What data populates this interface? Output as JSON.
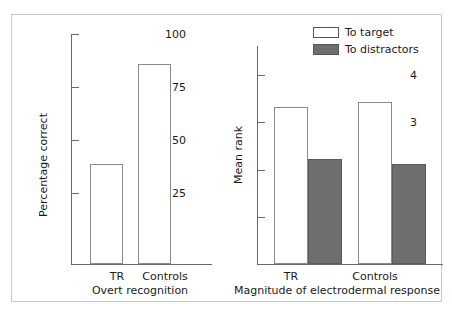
{
  "chart_data": [
    {
      "id": "overt-recognition",
      "type": "bar",
      "title": "",
      "xlabel": "Overt recognition",
      "ylabel": "Percentage correct",
      "categories": [
        "TR",
        "Controls"
      ],
      "values": [
        47,
        94
      ],
      "ylim": [
        0,
        100
      ],
      "yticks": [
        25,
        50,
        75,
        100
      ],
      "ytick_labels": [
        "25",
        "50",
        "75",
        "100"
      ],
      "grid": false,
      "legend": "none",
      "series": [
        {
          "name": "Percentage correct",
          "values": [
            47,
            94
          ],
          "fill": "white"
        }
      ]
    },
    {
      "id": "electrodermal-response",
      "type": "bar",
      "title": "",
      "xlabel": "Magnitude of electrodermal response",
      "ylabel": "Mean rank",
      "categories": [
        "TR",
        "Controls"
      ],
      "ylim": [
        0,
        4.6
      ],
      "yticks": [
        1,
        2,
        3,
        4
      ],
      "ytick_labels": [
        "1",
        "2",
        "3",
        "4"
      ],
      "grid": false,
      "legend": "top-right",
      "series": [
        {
          "name": "To target",
          "values": [
            3.3,
            3.4
          ],
          "fill": "white"
        },
        {
          "name": "To distractors",
          "values": [
            2.2,
            2.1
          ],
          "fill": "#6e6e6e"
        }
      ]
    }
  ],
  "left_chart": {
    "ylabel": "Percentage correct",
    "xlabel": "Overt recognition",
    "yticks": [
      {
        "label": "100",
        "value": 100
      },
      {
        "label": "75",
        "value": 75
      },
      {
        "label": "50",
        "value": 50
      },
      {
        "label": "25",
        "value": 25
      }
    ],
    "bars": [
      {
        "category": "TR",
        "value": 47
      },
      {
        "category": "Controls",
        "value": 94
      }
    ]
  },
  "right_chart": {
    "ylabel": "Mean rank",
    "xlabel": "Magnitude of electrodermal response",
    "yticks": [
      {
        "label": "4",
        "value": 4
      },
      {
        "label": "3",
        "value": 3
      },
      {
        "label": "2",
        "value": 2
      },
      {
        "label": "1",
        "value": 1
      }
    ],
    "legend": [
      {
        "label": "To target",
        "style": "open"
      },
      {
        "label": "To distractors",
        "style": "filled"
      }
    ],
    "groups": [
      {
        "category": "TR",
        "to_target": 3.3,
        "to_distractors": 2.2
      },
      {
        "category": "Controls",
        "to_target": 3.4,
        "to_distractors": 2.1
      }
    ]
  },
  "colors": {
    "fill_dark": "#6e6e6e",
    "fill_light": "#ffffff",
    "axis": "#6a6a6a",
    "frame": "#c9c9c9",
    "text": "#1a1a1a"
  }
}
